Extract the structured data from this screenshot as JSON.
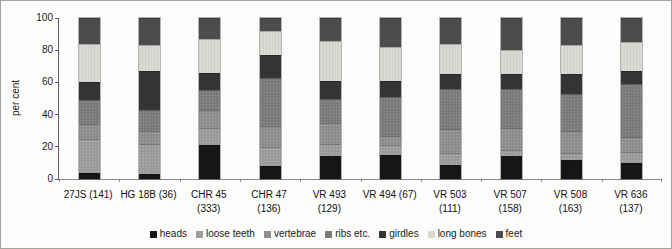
{
  "chart_data": {
    "type": "bar",
    "stacked": true,
    "title": "",
    "xlabel": "",
    "ylabel": "per cent",
    "ylim": [
      0,
      100
    ],
    "yticks": [
      0,
      20,
      40,
      60,
      80,
      100
    ],
    "grid": false,
    "legend_position": "bottom",
    "categories": [
      "27JS (141)",
      "HG 18B (36)",
      "CHR 45 (333)",
      "CHR 47 (136)",
      "VR 493 (129)",
      "VR 494 (67)",
      "VR 503 (111)",
      "VR 507 (158)",
      "VR 508 (163)",
      "VR 636 (137)"
    ],
    "category_lines": [
      [
        "27JS (141)"
      ],
      [
        "HG 18B (36)"
      ],
      [
        "CHR 45",
        "(333)"
      ],
      [
        "CHR 47",
        "(136)"
      ],
      [
        "VR 493",
        "(129)"
      ],
      [
        "VR 494 (67)"
      ],
      [
        "VR 503",
        "(111)"
      ],
      [
        "VR 507",
        "(158)"
      ],
      [
        "VR 508",
        "(163)"
      ],
      [
        "VR 636",
        "(137)"
      ]
    ],
    "series": [
      {
        "name": "heads",
        "color": "#161616",
        "values": [
          4,
          3,
          21,
          8,
          14,
          15,
          9,
          14,
          12,
          10
        ]
      },
      {
        "name": "loose teeth",
        "color": "#9d9d9d",
        "values": [
          21,
          19,
          11,
          12,
          8,
          6,
          7,
          4,
          4,
          7
        ]
      },
      {
        "name": "vertebrae",
        "color": "#8f8f8f",
        "values": [
          9,
          8,
          11,
          13,
          13,
          6,
          15,
          14,
          14,
          9
        ]
      },
      {
        "name": "ribs etc.",
        "color": "#7c7c7c",
        "values": [
          15,
          13,
          12,
          30,
          15,
          24,
          25,
          24,
          23,
          33
        ]
      },
      {
        "name": "girdles",
        "color": "#343434",
        "values": [
          11,
          24,
          11,
          14,
          11,
          10,
          9,
          9,
          12,
          8
        ]
      },
      {
        "name": "long bones",
        "color": "#d9d9d6",
        "values": [
          24,
          16,
          21,
          15,
          25,
          21,
          19,
          15,
          18,
          18
        ]
      },
      {
        "name": "feet",
        "color": "#4c4c4c",
        "values": [
          16,
          17,
          13,
          8,
          14,
          18,
          16,
          20,
          17,
          15
        ]
      }
    ]
  }
}
